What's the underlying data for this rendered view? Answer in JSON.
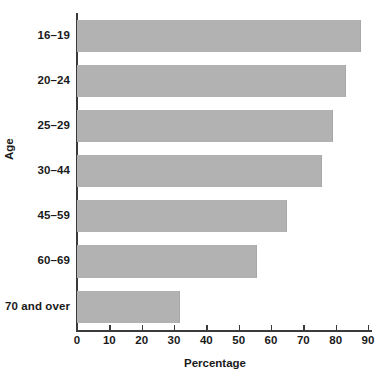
{
  "chart_data": {
    "type": "bar",
    "orientation": "horizontal",
    "title": "",
    "xlabel": "Percentage",
    "ylabel": "Age",
    "categories": [
      "16–19",
      "20–24",
      "25–29",
      "30–44",
      "45–59",
      "60–69",
      "70 and over"
    ],
    "values": [
      87.5,
      83,
      79,
      75.5,
      64.5,
      55.5,
      31.5
    ],
    "series": [
      {
        "name": "Percentage",
        "values": [
          87.5,
          83,
          79,
          75.5,
          64.5,
          55.5,
          31.5
        ]
      }
    ],
    "xlim": [
      0,
      90
    ],
    "xticks": [
      0,
      10,
      20,
      30,
      40,
      50,
      60,
      70,
      80,
      90
    ],
    "xtick_labels": [
      "0",
      "10",
      "20",
      "30",
      "40",
      "50",
      "60",
      "70",
      "80",
      "90"
    ],
    "grid": false,
    "legend": false,
    "bar_color": "#b2b2b2",
    "axis_color": "#3a3a3a",
    "text_color": "#1a1a1a",
    "background_color": "#ffffff"
  }
}
